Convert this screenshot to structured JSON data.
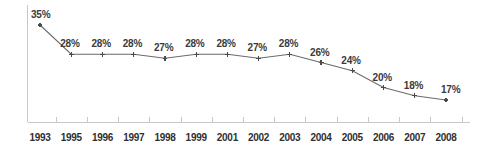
{
  "chart_data": {
    "type": "line",
    "title": "",
    "xlabel": "",
    "ylabel": "",
    "grid": false,
    "legend": "none",
    "ylim": [
      0,
      40
    ],
    "categories": [
      "1993",
      "1995",
      "1996",
      "1997",
      "1998",
      "1999",
      "2001",
      "2002",
      "2003",
      "2004",
      "2005",
      "2006",
      "2007",
      "2008"
    ],
    "values": [
      35,
      28,
      28,
      28,
      27,
      28,
      28,
      27,
      28,
      26,
      24,
      20,
      18,
      17
    ],
    "data_labels": [
      "35%",
      "28%",
      "28%",
      "28%",
      "27%",
      "28%",
      "28%",
      "27%",
      "28%",
      "26%",
      "24%",
      "20%",
      "18%",
      "17%"
    ],
    "series": [
      {
        "name": "",
        "values": [
          35,
          28,
          28,
          28,
          27,
          28,
          28,
          27,
          28,
          26,
          24,
          20,
          18,
          17
        ]
      }
    ]
  },
  "style": {
    "line_color": "#6b6b6b",
    "marker_color": "#4a4a4a",
    "axis_color": "#c8c8c8",
    "label_color": "#3a3a3a",
    "background": "#ffffff"
  }
}
